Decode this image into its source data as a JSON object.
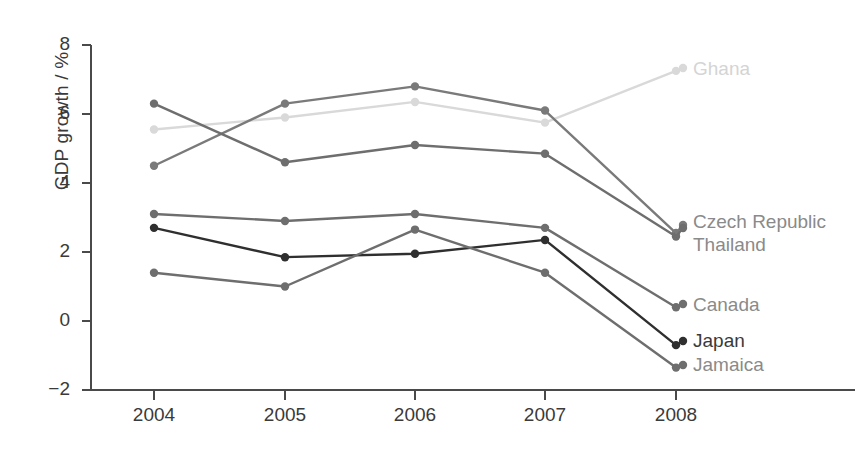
{
  "chart_data": {
    "type": "line",
    "title": "",
    "xlabel": "",
    "ylabel": "GDP growth / %",
    "x": [
      "2004",
      "2005",
      "2006",
      "2007",
      "2008"
    ],
    "xtick_labels": [
      "2004",
      "2005",
      "2006",
      "2007",
      "2008"
    ],
    "ytick_labels": [
      "8",
      "6",
      "4",
      "2",
      "0",
      "−2"
    ],
    "ytick_values": [
      8,
      6,
      4,
      2,
      0,
      -2
    ],
    "ylim": [
      -2,
      8
    ],
    "grid": false,
    "legend_position": "right-inline-labels",
    "series": [
      {
        "name": "Ghana",
        "color": "#d9d9d9",
        "label": "Ghana",
        "values": [
          5.55,
          5.9,
          6.35,
          5.75,
          7.25
        ]
      },
      {
        "name": "Czech Republic",
        "color": "#7a7a7a",
        "label": "Czech Republic",
        "values": [
          4.5,
          6.3,
          6.8,
          6.1,
          2.55
        ]
      },
      {
        "name": "Thailand",
        "color": "#6e6e6e",
        "label": "Thailand",
        "values": [
          6.3,
          4.6,
          5.1,
          4.85,
          2.45
        ]
      },
      {
        "name": "Canada",
        "color": "#6e6e6e",
        "label": "Canada",
        "values": [
          3.1,
          2.9,
          3.1,
          2.7,
          0.4
        ]
      },
      {
        "name": "Japan",
        "color": "#2f2f2f",
        "label": "Japan",
        "values": [
          2.7,
          1.85,
          1.95,
          2.35,
          -0.7
        ]
      },
      {
        "name": "Jamaica",
        "color": "#6e6e6e",
        "label": "Jamaica",
        "values": [
          1.4,
          1.0,
          2.65,
          1.4,
          -1.35
        ]
      }
    ]
  },
  "axis": {
    "y_title": "GDP growth / %",
    "y_ticks": [
      "8",
      "6",
      "4",
      "2",
      "0",
      "−2"
    ],
    "x_ticks": [
      "2004",
      "2005",
      "2006",
      "2007",
      "2008"
    ]
  },
  "labels": {
    "ghana": "Ghana",
    "czech_republic": "Czech Republic",
    "thailand": "Thailand",
    "canada": "Canada",
    "japan": "Japan",
    "jamaica": "Jamaica"
  },
  "colors": {
    "axis": "#4a4a4a",
    "text": "#3a3a3a",
    "ghana": "#d9d9d9",
    "czech_republic": "#7a7a7a",
    "thailand": "#6e6e6e",
    "canada": "#6e6e6e",
    "japan": "#2f2f2f",
    "jamaica": "#6e6e6e",
    "label_light": "#d4d4d4",
    "label_mid": "#8a8a8a",
    "label_dark": "#3a3a3a"
  }
}
